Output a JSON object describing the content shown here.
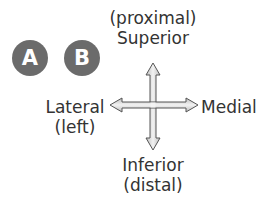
{
  "badges": [
    {
      "label": "A",
      "color": "#6b6b6b"
    },
    {
      "label": "B",
      "color": "#6b6b6b"
    }
  ],
  "directions": {
    "superior": {
      "line1": "(proximal)",
      "line2": "Superior"
    },
    "inferior": {
      "line1": "Inferior",
      "line2": "(distal)"
    },
    "lateral": {
      "line1": "Lateral",
      "line2": "(left)"
    },
    "medial": {
      "line1": "Medial"
    }
  },
  "colors": {
    "text": "#333333",
    "badge": "#6b6b6b",
    "arrow_stroke": "#555555",
    "arrow_fill": "#d9d9d9"
  }
}
